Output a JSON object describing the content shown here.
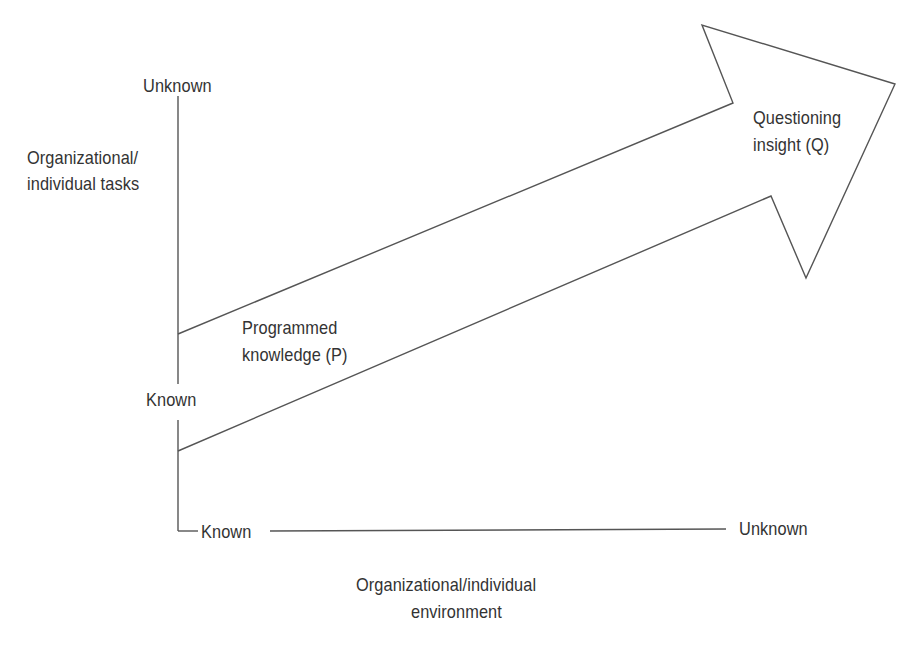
{
  "diagram": {
    "y_axis": {
      "title_line1": "Organizational/",
      "title_line2": "individual tasks",
      "top_label": "Unknown",
      "bottom_label": "Known"
    },
    "x_axis": {
      "title_line1": "Organizational/individual",
      "title_line2": "environment",
      "left_label": "Known",
      "right_label": "Unknown"
    },
    "arrow": {
      "tail_label_line1": "Programmed",
      "tail_label_line2": "knowledge (P)",
      "head_label_line1": "Questioning",
      "head_label_line2": "insight (Q)"
    },
    "colors": {
      "stroke": "#555555",
      "text": "#333333",
      "background": "#ffffff"
    }
  }
}
